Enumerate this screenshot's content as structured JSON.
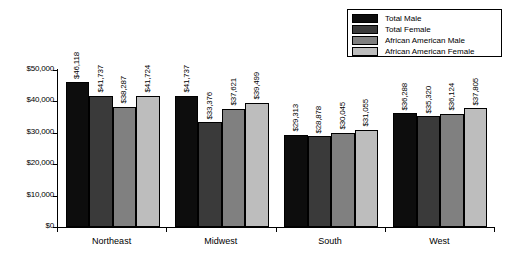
{
  "chart_data": {
    "type": "bar",
    "title": "",
    "subtitle": "",
    "xlabel": "",
    "ylabel": "",
    "categories": [
      "Northeast",
      "Midwest",
      "South",
      "West"
    ],
    "series": [
      {
        "name": "Total Male",
        "color": "#0d0d0d",
        "values": [
          46118,
          41737,
          29313,
          36288
        ],
        "labels": [
          "$46,118",
          "$41,737",
          "$29,313",
          "$36,288"
        ]
      },
      {
        "name": "Total Female",
        "color": "#3a3a3a",
        "values": [
          41737,
          33376,
          28878,
          35320
        ],
        "labels": [
          "$41,737",
          "$33,376",
          "$28,878",
          "$35,320"
        ]
      },
      {
        "name": "African American Male",
        "color": "#808080",
        "values": [
          38287,
          37621,
          30045,
          36124
        ],
        "labels": [
          "$38,287",
          "$37,621",
          "$30,045",
          "$36,124"
        ]
      },
      {
        "name": "African American Female",
        "color": "#bdbdbd",
        "values": [
          41724,
          39499,
          31055,
          37805
        ],
        "labels": [
          "$41,724",
          "$39,499",
          "$31,055",
          "$37,805"
        ]
      }
    ],
    "ylim": [
      0,
      50000
    ],
    "ytick_values": [
      0,
      10000,
      20000,
      30000,
      40000,
      50000
    ],
    "ytick_labels": [
      "$0",
      "$10,000",
      "$20,000",
      "$30,000",
      "$40,000",
      "$50,000"
    ],
    "grid": false,
    "legend_position": "top-right",
    "value_labels_rotated": true
  },
  "legend": {
    "items": [
      {
        "label": "Total Male",
        "color": "#0d0d0d"
      },
      {
        "label": "Total Female",
        "color": "#3a3a3a"
      },
      {
        "label": "African American Male",
        "color": "#808080"
      },
      {
        "label": "African American Female",
        "color": "#bdbdbd"
      }
    ]
  }
}
